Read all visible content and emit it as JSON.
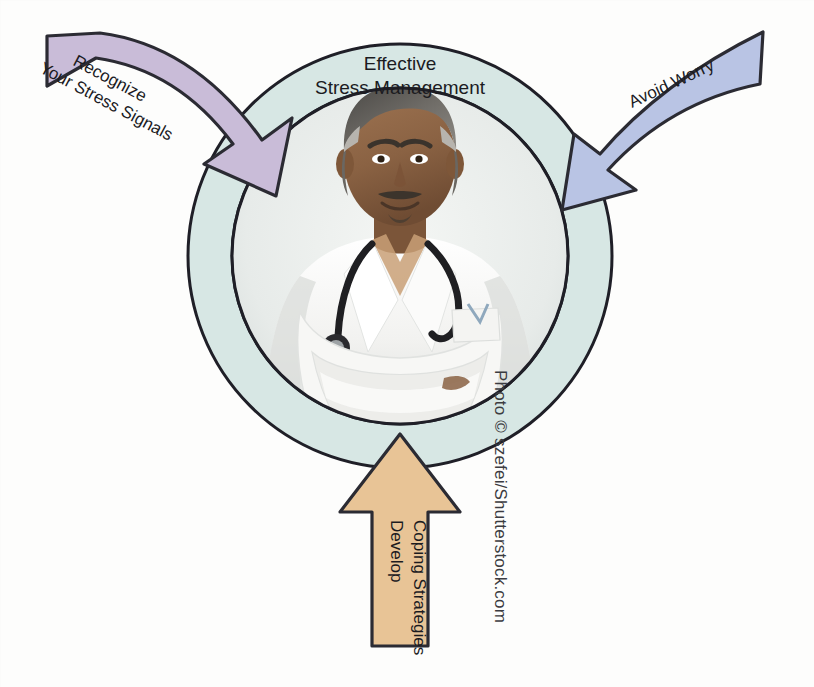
{
  "figure": {
    "title_line1": "Effective",
    "title_line2": "Stress Management",
    "center_photo_alt": "doctor-with-stethoscope-arms-crossed",
    "credit": "Photo © szefei/Shutterstock.com"
  },
  "arrows": [
    {
      "id": "recognize",
      "label_line1": "Recognize",
      "label_line2": "Your Stress Signals",
      "color": "#c9bcd8",
      "stroke": "#2b2b33",
      "direction": "down-right",
      "position": "top-left"
    },
    {
      "id": "avoid-worry",
      "label_line1": "Avoid Worry",
      "label_line2": "",
      "color": "#b9c4e4",
      "stroke": "#2b2b33",
      "direction": "down-left",
      "position": "top-right"
    },
    {
      "id": "develop-coping",
      "label_line1": "Develop",
      "label_line2": "Coping Strategies",
      "color": "#e8c496",
      "stroke": "#2b2b33",
      "direction": "up",
      "position": "bottom-center"
    }
  ],
  "colors": {
    "ring_fill": "#d7e7e4",
    "ring_stroke": "#1f1f27",
    "background": "#fdfdfc",
    "purple_arrow": "#c9bcd8",
    "blue_arrow": "#b9c4e4",
    "tan_arrow": "#e8c496"
  },
  "geometry": {
    "center_x": 400,
    "center_y": 256,
    "outer_radius": 212,
    "inner_radius": 168
  }
}
